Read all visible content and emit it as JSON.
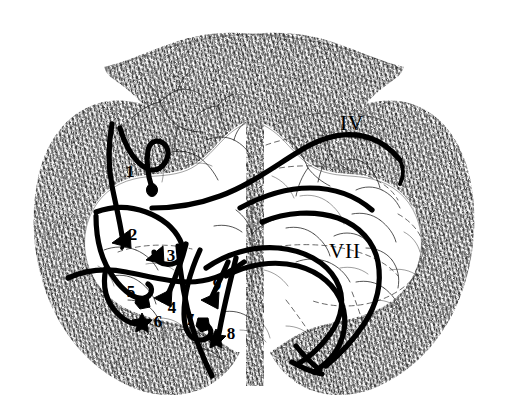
{
  "figure": {
    "kind": "spinal-cord-cross-section",
    "caption_title": "",
    "background_color": "#ffffff",
    "ink_color": "#000000",
    "white_matter_color": "#3a3a3a",
    "width": 507,
    "height": 414
  },
  "region_labels": [
    {
      "id": "lamina-4",
      "text": "IV",
      "x": 352,
      "y": 130,
      "kind": "roman-numeral",
      "meaning": "lamina-four"
    },
    {
      "id": "lamina-7",
      "text": "VII",
      "x": 345,
      "y": 258,
      "kind": "roman-numeral",
      "meaning": "lamina-seven"
    }
  ],
  "terminal_labels": [
    {
      "id": "t1",
      "text": "1",
      "x": 130,
      "y": 177,
      "marker_x": 152,
      "marker_y": 190,
      "marker": "bouton"
    },
    {
      "id": "t2",
      "text": "2",
      "x": 130,
      "y": 240,
      "marker_x": 122,
      "marker_y": 238,
      "marker": "arrowhead"
    },
    {
      "id": "t3",
      "text": "3",
      "x": 167,
      "y": 259,
      "marker_x": 155,
      "marker_y": 256,
      "marker": "arrowhead"
    },
    {
      "id": "t4",
      "text": "4",
      "x": 171,
      "y": 311,
      "marker_x": 163,
      "marker_y": 298,
      "marker": "arrowhead"
    },
    {
      "id": "t5",
      "text": "5",
      "x": 132,
      "y": 297,
      "marker_x": 142,
      "marker_y": 303,
      "marker": "bouton"
    },
    {
      "id": "t6",
      "text": "6",
      "x": 156,
      "y": 325,
      "marker_x": 142,
      "marker_y": 321,
      "marker": "star"
    },
    {
      "id": "t7",
      "text": "7",
      "x": 192,
      "y": 325,
      "marker_x": 203,
      "marker_y": 325,
      "marker": "bouton"
    },
    {
      "id": "t8",
      "text": "8",
      "x": 228,
      "y": 338,
      "marker_x": 216,
      "marker_y": 337,
      "marker": "star"
    },
    {
      "id": "t9",
      "text": "9",
      "x": 216,
      "y": 290,
      "marker_x": 210,
      "marker_y": 300,
      "marker": "arrowhead"
    }
  ],
  "anatomy_notes": {
    "white_matter": "stippled peripheral ring",
    "gray_matter": "central butterfly-shaped region",
    "dorsal_funiculus": "top arc of stipple",
    "ventral_median_fissure": "bottom center notch",
    "dorsal_median_septum": "top center stipple column"
  }
}
